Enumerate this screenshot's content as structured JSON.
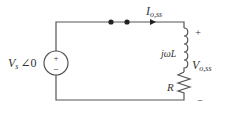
{
  "diagram": {
    "type": "ac-circuit",
    "source": {
      "label_main": "V",
      "label_sub": "s",
      "label_angle": "∠0",
      "plus": "+",
      "minus": "−"
    },
    "current": {
      "label_main": "I",
      "label_sub": "o,ss"
    },
    "inductor": {
      "label": "jωL"
    },
    "resistor": {
      "label": "R"
    },
    "output_voltage": {
      "label_main": "V",
      "label_sub": "o,ss",
      "plus": "+",
      "minus": "−"
    },
    "colors": {
      "wire": "#555555",
      "text": "#333333",
      "background": "#ffffff"
    }
  }
}
